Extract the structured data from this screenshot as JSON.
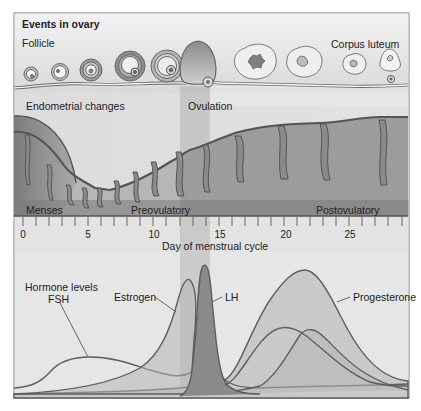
{
  "diagram": {
    "ovary_section": {
      "title": "Events in ovary",
      "follicle_label": "Follicle",
      "corpus_luteum_label": "Corpus luteum",
      "ovulation_label": "Ovulation"
    },
    "endometrium_section": {
      "title": "Endometrial changes",
      "phases": [
        "Menses",
        "Preovulatory",
        "Postovulatory"
      ]
    },
    "axis": {
      "label": "Day of menstrual cycle",
      "ticks": [
        "0",
        "5",
        "10",
        "15",
        "20",
        "25"
      ],
      "min_day": 0,
      "max_day": 28
    },
    "hormone_section": {
      "title": "Hormone levels",
      "hormones": [
        "FSH",
        "Estrogen",
        "LH",
        "Progesterone"
      ]
    },
    "colors": {
      "frame": "#7a7a7a",
      "light_bg": "#e6e6e6",
      "ovulation_band": "#c9c9c9",
      "endometrium_dark": "#8a8a8a",
      "curve_line": "#5e5e5e"
    }
  }
}
